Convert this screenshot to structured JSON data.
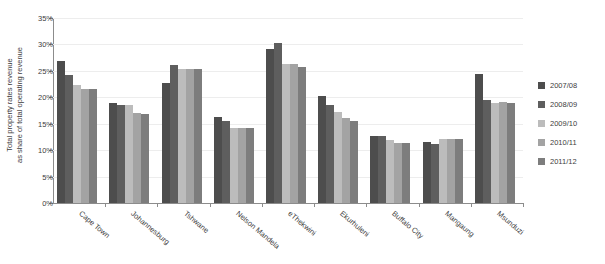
{
  "chart_data": {
    "type": "bar",
    "title": "",
    "xlabel": "",
    "ylabel": "Total property rates revenue as share of total operating revenue",
    "ylabel_line1": "Total property rates revenue",
    "ylabel_line2": "as share of total operating revenue",
    "ylim": [
      0,
      35
    ],
    "ytick_labels": [
      "0%",
      "5%",
      "10%",
      "15%",
      "20%",
      "25%",
      "30%",
      "35%"
    ],
    "ytick_values": [
      0,
      5,
      10,
      15,
      20,
      25,
      30,
      35
    ],
    "grid": true,
    "legend_position": "right",
    "categories": [
      "Cape Town",
      "Johannesburg",
      "Tshwane",
      "Nelson Mandela",
      "eThekwini",
      "Ekurhuleni",
      "Buffalo City",
      "Mangaung",
      "Msunduzi"
    ],
    "series": [
      {
        "name": "2007/08",
        "color": "#4d4d4d",
        "values": [
          26.8,
          19.0,
          22.7,
          16.2,
          29.2,
          20.3,
          12.7,
          11.5,
          24.5
        ]
      },
      {
        "name": "2008/09",
        "color": "#5e5e5e",
        "values": [
          24.2,
          18.6,
          26.2,
          15.6,
          30.3,
          18.6,
          12.7,
          11.1,
          19.5
        ]
      },
      {
        "name": "2009/10",
        "color": "#bcbcbc",
        "values": [
          22.3,
          18.5,
          25.4,
          14.2,
          26.3,
          17.2,
          12.0,
          12.1,
          19.0
        ]
      },
      {
        "name": "2010/11",
        "color": "#a3a3a3",
        "values": [
          21.6,
          17.0,
          25.3,
          14.2,
          26.3,
          16.0,
          11.4,
          12.1,
          19.2
        ]
      },
      {
        "name": "2011/12",
        "color": "#7d7d7d",
        "values": [
          21.5,
          16.8,
          25.3,
          14.1,
          25.7,
          15.5,
          11.4,
          12.1,
          19.0
        ]
      }
    ]
  },
  "colors": {
    "axis": "#8c8c8c",
    "grid": "#ededed",
    "text": "#3d3d3d",
    "background": "#ffffff"
  }
}
